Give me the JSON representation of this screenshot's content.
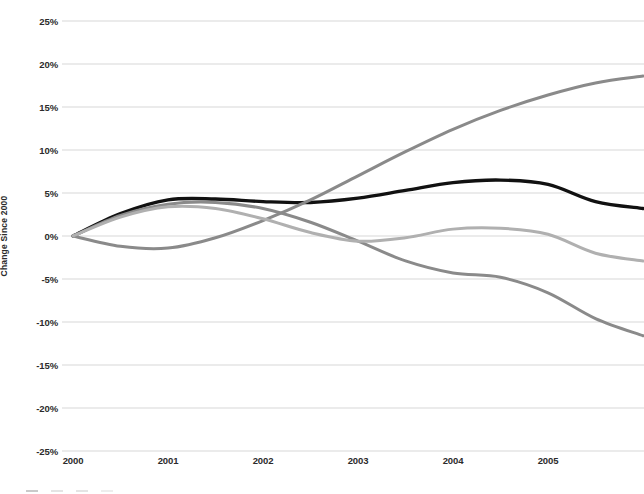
{
  "chart_data": {
    "type": "line",
    "title": "",
    "xlabel": "",
    "ylabel": "Change Since 2000",
    "ylim": [
      -25,
      25
    ],
    "xlim": [
      2000,
      2006
    ],
    "grid": true,
    "legend_position": "bottom-left",
    "ytick_labels": [
      "25%",
      "20%",
      "15%",
      "10%",
      "5%",
      "0%",
      "-5%",
      "-10%",
      "-15%",
      "-20%",
      "-25%"
    ],
    "ytick_values": [
      25,
      20,
      15,
      10,
      5,
      0,
      -5,
      -10,
      -15,
      -20,
      -25
    ],
    "xtick_labels": [
      "2000",
      "2001",
      "2002",
      "2003",
      "2004",
      "2005"
    ],
    "xtick_values": [
      2000,
      2001,
      2002,
      2003,
      2004,
      2005
    ],
    "x": [
      2000.0,
      2000.5,
      2001.0,
      2001.5,
      2002.0,
      2002.5,
      2003.0,
      2003.5,
      2004.0,
      2004.5,
      2005.0,
      2005.5,
      2006.0
    ],
    "series": [
      {
        "name": "series-black",
        "color": "#111111",
        "width": 3.4,
        "values": [
          0.0,
          2.6,
          4.2,
          4.3,
          4.0,
          3.9,
          4.4,
          5.3,
          6.2,
          6.5,
          6.0,
          4.0,
          3.2
        ]
      },
      {
        "name": "series-dark-gray-rising",
        "color": "#8a8a8a",
        "width": 3.0,
        "values": [
          0.0,
          -1.2,
          -1.4,
          -0.2,
          1.8,
          4.2,
          7.0,
          9.8,
          12.4,
          14.6,
          16.4,
          17.8,
          18.6
        ]
      },
      {
        "name": "series-mid-gray-falling",
        "color": "#8a8a8a",
        "width": 3.0,
        "values": [
          0.0,
          2.4,
          3.7,
          3.9,
          3.2,
          1.6,
          -0.6,
          -2.9,
          -4.3,
          -4.8,
          -6.6,
          -9.6,
          -11.6
        ]
      },
      {
        "name": "series-light-gray",
        "color": "#b0b0b0",
        "width": 3.0,
        "values": [
          0.0,
          2.2,
          3.4,
          3.2,
          2.0,
          0.4,
          -0.6,
          -0.2,
          0.8,
          0.9,
          0.2,
          -2.0,
          -2.9
        ]
      }
    ],
    "legend_entries": [
      "",
      "",
      "",
      ""
    ]
  },
  "axis": {
    "y_title": "Change Since 2000"
  }
}
